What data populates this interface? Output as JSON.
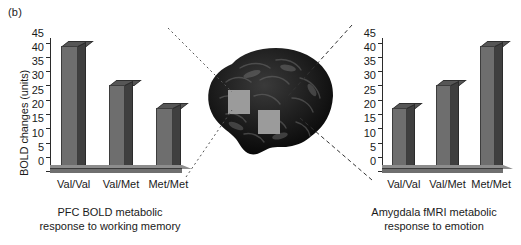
{
  "figure": {
    "panel_label": "(b)"
  },
  "brain": {
    "alt": "grayscale sagittal brain image",
    "regions": [
      {
        "name": "prefrontal-cortex-roi"
      },
      {
        "name": "amygdala-roi"
      }
    ]
  },
  "chart_data": [
    {
      "id": "pfc",
      "type": "bar",
      "title": "",
      "caption_line1": "PFC BOLD metabolic",
      "caption_line2": "response to working memory",
      "xlabel": "",
      "ylabel": "BOLD changes (units)",
      "categories": [
        "Val/Val",
        "Val/Met",
        "Met/Met"
      ],
      "values": [
        44,
        30,
        22
      ],
      "ylim": [
        0,
        47
      ],
      "yticks": [
        0,
        5,
        10,
        15,
        20,
        25,
        30,
        35,
        40,
        45
      ],
      "grid": false,
      "legend": "none",
      "bar_color": "#6e6e6e"
    },
    {
      "id": "amygdala",
      "type": "bar",
      "title": "",
      "caption_line1": "Amygdala fMRI metabolic",
      "caption_line2": "response to emotion",
      "xlabel": "",
      "ylabel": "",
      "categories": [
        "Val/Val",
        "Val/Met",
        "Met/Met"
      ],
      "values": [
        22,
        30,
        44
      ],
      "ylim": [
        0,
        47
      ],
      "yticks": [
        0,
        5,
        10,
        15,
        20,
        25,
        30,
        35,
        40,
        45
      ],
      "grid": false,
      "legend": "none",
      "bar_color": "#6e6e6e"
    }
  ]
}
